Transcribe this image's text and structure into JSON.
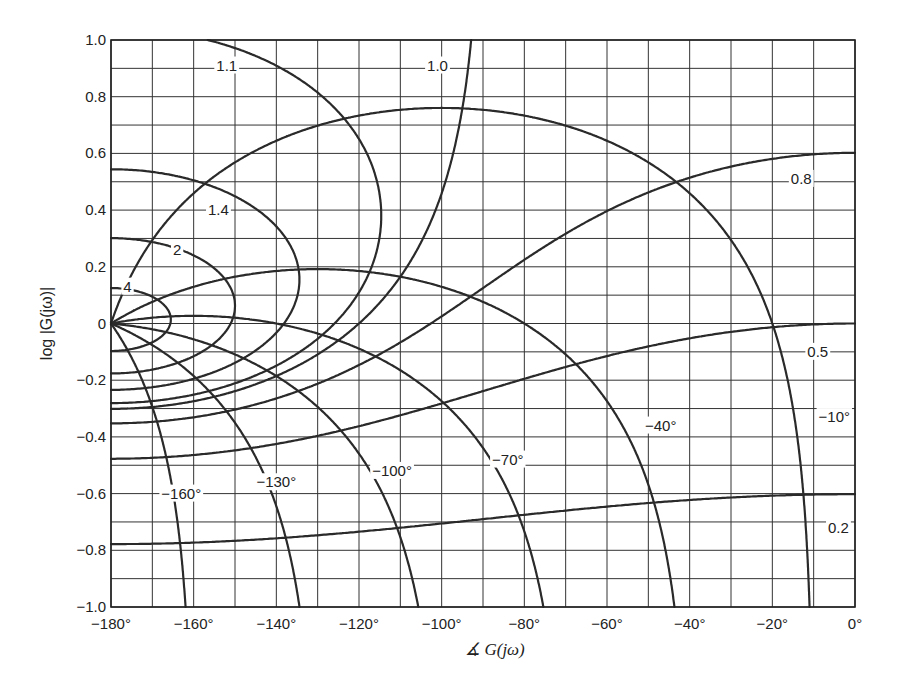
{
  "chart_data": {
    "type": "line",
    "subtype": "nichols_chart",
    "title": "",
    "xlabel": "∡ G(jω)",
    "ylabel": "log |G(jω)|",
    "xlim": [
      -180,
      0
    ],
    "ylim": [
      -1.0,
      1.0
    ],
    "grid": true,
    "grid_step": {
      "x": 10,
      "y": 0.1
    },
    "x_ticks": [
      -180,
      -160,
      -140,
      -120,
      -100,
      -80,
      -60,
      -40,
      -20,
      0
    ],
    "x_tick_labels": [
      "−180°",
      "−160°",
      "−140°",
      "−120°",
      "−100°",
      "−80°",
      "−60°",
      "−40°",
      "−20°",
      "0°"
    ],
    "y_ticks": [
      1.0,
      0.8,
      0.6,
      0.4,
      0.2,
      0,
      -0.2,
      -0.4,
      -0.6,
      -0.8,
      -1.0
    ],
    "y_tick_labels": [
      "1.0",
      "0.8",
      "0.6",
      "0.4",
      "0.2",
      "0",
      "−0.2",
      "−0.4",
      "−0.6",
      "−0.8",
      "−1.0"
    ],
    "series": [
      {
        "name": "M = 1.1",
        "kind": "constant_magnitude",
        "M": 1.1,
        "label": "1.1",
        "label_pos": [
          -152,
          0.91
        ]
      },
      {
        "name": "M = 1.0",
        "kind": "constant_magnitude",
        "M": 1.0,
        "label": "1.0",
        "label_pos": [
          -101,
          0.91
        ]
      },
      {
        "name": "M = 1.4",
        "kind": "constant_magnitude",
        "M": 1.4,
        "label": "1.4",
        "label_pos": [
          -154,
          0.4
        ]
      },
      {
        "name": "M = 2",
        "kind": "constant_magnitude",
        "M": 2.0,
        "label": "2",
        "label_pos": [
          -164,
          0.26
        ]
      },
      {
        "name": "M = 4",
        "kind": "constant_magnitude",
        "M": 4.0,
        "label": "4",
        "label_pos": [
          -176,
          0.13
        ]
      },
      {
        "name": "M = 0.8",
        "kind": "constant_magnitude",
        "M": 0.8,
        "label": "0.8",
        "label_pos": [
          -13,
          0.51
        ]
      },
      {
        "name": "M = 0.5",
        "kind": "constant_magnitude",
        "M": 0.5,
        "label": "0.5",
        "label_pos": [
          -9,
          -0.1
        ]
      },
      {
        "name": "M = 0.2",
        "kind": "constant_magnitude",
        "M": 0.2,
        "label": "0.2",
        "label_pos": [
          -4,
          -0.72
        ]
      },
      {
        "name": "N = −10°",
        "kind": "constant_phase",
        "alpha": -10,
        "label": "−10°",
        "label_pos": [
          -5,
          -0.33
        ]
      },
      {
        "name": "N = −40°",
        "kind": "constant_phase",
        "alpha": -40,
        "label": "−40°",
        "label_pos": [
          -47,
          -0.36
        ]
      },
      {
        "name": "N = −70°",
        "kind": "constant_phase",
        "alpha": -70,
        "label": "−70°",
        "label_pos": [
          -84,
          -0.48
        ]
      },
      {
        "name": "N = −100°",
        "kind": "constant_phase",
        "alpha": -100,
        "label": "−100°",
        "label_pos": [
          -112,
          -0.52
        ]
      },
      {
        "name": "N = −130°",
        "kind": "constant_phase",
        "alpha": -130,
        "label": "−130°",
        "label_pos": [
          -140,
          -0.56
        ]
      },
      {
        "name": "N = −160°",
        "kind": "constant_phase",
        "alpha": -160,
        "label": "−160°",
        "label_pos": [
          -163,
          -0.6
        ]
      }
    ]
  },
  "colors": {
    "background": "#ffffff",
    "grid": "#333333",
    "curve": "#2a2a2a",
    "text": "#222222"
  }
}
